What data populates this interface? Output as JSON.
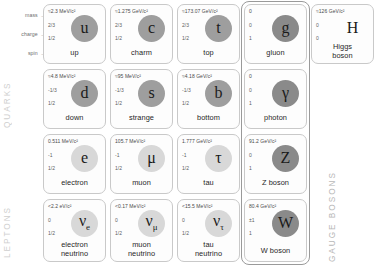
{
  "axis_labels": [
    {
      "text": "mass",
      "arrow": "→"
    },
    {
      "text": "charge",
      "arrow": "→"
    },
    {
      "text": "spin",
      "arrow": "→"
    }
  ],
  "side_labels": {
    "quarks": "QUARKS",
    "leptons": "LEPTONS",
    "gauge_bosons": "GAUGE BOSONS"
  },
  "colors": {
    "quark_orb": "#9e9e9e",
    "lepton_orb": "#d8d8d8",
    "boson_orb": "#8a8a8a",
    "cell_border": "#c9c9c9",
    "boson_group_border": "#9a9a9a",
    "side_label": "#cfcfcf",
    "prop_text": "#5e5e5e"
  },
  "chart_data": {
    "type": "table",
    "columns": [
      "generation I",
      "generation II",
      "generation III",
      "gauge bosons",
      "scalar boson"
    ],
    "rows": [
      "quarks up-type",
      "quarks down-type",
      "leptons charged",
      "leptons neutral"
    ],
    "particles": [
      {
        "symbol": "u",
        "name": "up",
        "mass": "≈2.3 MeV/c²",
        "charge": "2/3",
        "spin": "1/2",
        "group": "quark",
        "col": 0,
        "row": 0
      },
      {
        "symbol": "c",
        "name": "charm",
        "mass": "≈1.275 GeV/c²",
        "charge": "2/3",
        "spin": "1/2",
        "group": "quark",
        "col": 1,
        "row": 0
      },
      {
        "symbol": "t",
        "name": "top",
        "mass": "≈173.07 GeV/c²",
        "charge": "2/3",
        "spin": "1/2",
        "group": "quark",
        "col": 2,
        "row": 0
      },
      {
        "symbol": "g",
        "name": "gluon",
        "mass": "0",
        "charge": "0",
        "spin": "1",
        "group": "boson",
        "col": 3,
        "row": 0
      },
      {
        "symbol": "H",
        "name": "Higgs boson",
        "mass": "≈126 GeV/c²",
        "charge": "0",
        "spin": "0",
        "group": "higgs",
        "col": 4,
        "row": 0
      },
      {
        "symbol": "d",
        "name": "down",
        "mass": "≈4.8 MeV/c²",
        "charge": "-1/3",
        "spin": "1/2",
        "group": "quark",
        "col": 0,
        "row": 1
      },
      {
        "symbol": "s",
        "name": "strange",
        "mass": "≈95 MeV/c²",
        "charge": "-1/3",
        "spin": "1/2",
        "group": "quark",
        "col": 1,
        "row": 1
      },
      {
        "symbol": "b",
        "name": "bottom",
        "mass": "≈4.18 GeV/c²",
        "charge": "-1/3",
        "spin": "1/2",
        "group": "quark",
        "col": 2,
        "row": 1
      },
      {
        "symbol": "γ",
        "name": "photon",
        "mass": "0",
        "charge": "0",
        "spin": "1",
        "group": "boson",
        "col": 3,
        "row": 1
      },
      {
        "symbol": "e",
        "name": "electron",
        "mass": "0.511 MeV/c²",
        "charge": "-1",
        "spin": "1/2",
        "group": "lepton",
        "col": 0,
        "row": 2
      },
      {
        "symbol": "μ",
        "name": "muon",
        "mass": "105.7 MeV/c²",
        "charge": "-1",
        "spin": "1/2",
        "group": "lepton",
        "col": 1,
        "row": 2
      },
      {
        "symbol": "τ",
        "name": "tau",
        "mass": "1.777 GeV/c²",
        "charge": "-1",
        "spin": "1/2",
        "group": "lepton",
        "col": 2,
        "row": 2
      },
      {
        "symbol": "Z",
        "name": "Z boson",
        "mass": "91.2 GeV/c²",
        "charge": "0",
        "spin": "1",
        "group": "boson",
        "col": 3,
        "row": 2
      },
      {
        "symbol": "ν",
        "sub": "e",
        "name": "electron neutrino",
        "name_line1": "electron",
        "name_line2": "neutrino",
        "mass": "<2.2 eV/c²",
        "charge": "0",
        "spin": "1/2",
        "group": "lepton",
        "col": 0,
        "row": 3
      },
      {
        "symbol": "ν",
        "sub": "μ",
        "name": "muon neutrino",
        "name_line1": "muon",
        "name_line2": "neutrino",
        "mass": "<0.17 MeV/c²",
        "charge": "0",
        "spin": "1/2",
        "group": "lepton",
        "col": 1,
        "row": 3
      },
      {
        "symbol": "ν",
        "sub": "τ",
        "name": "tau neutrino",
        "name_line1": "tau",
        "name_line2": "neutrino",
        "mass": "<15.5 MeV/c²",
        "charge": "0",
        "spin": "1/2",
        "group": "lepton",
        "col": 2,
        "row": 3
      },
      {
        "symbol": "W",
        "name": "W boson",
        "mass": "80.4 GeV/c²",
        "charge": "±1",
        "spin": "1",
        "group": "boson",
        "col": 3,
        "row": 3
      }
    ]
  }
}
